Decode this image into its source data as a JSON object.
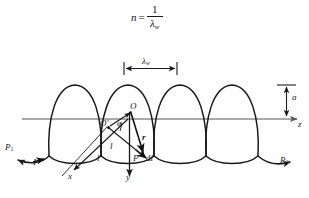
{
  "figure": {
    "type": "physics-diagram",
    "formula": {
      "variable": "n",
      "equals": "=",
      "numerator": "1",
      "denominator_symbol": "λ",
      "denominator_subscript": "w"
    },
    "axis": {
      "z_label": "z",
      "x_label": "x",
      "y_label": "y"
    },
    "measurements": {
      "wavelength_label": "λ",
      "wavelength_subscript": "w",
      "amplitude_label": "a"
    },
    "points": {
      "origin_label": "O",
      "source_label": "O′",
      "field_point_label": "P",
      "terminal_left_label": "P",
      "terminal_left_subscript": "1",
      "terminal_right_label": "P",
      "terminal_right_subscript": "2"
    },
    "vectors": {
      "radius_label": "r",
      "element_prefix": "d",
      "element_symbol": "l",
      "current_label": "I",
      "arc_length_label_1": "l",
      "arc_length_label_2": "l",
      "angle_label": "φ"
    },
    "colors": {
      "stroke": "#1a1a1a",
      "axis": "#555555",
      "background": "#ffffff"
    },
    "geometry": {
      "loop_count": 4,
      "loop_centers_x": [
        75,
        128,
        180,
        232
      ],
      "axis_y": 119,
      "loop_top_y": 85,
      "loop_bottom_y": 156,
      "loop_half_width": 26,
      "wavelength_span_x": [
        124,
        177
      ],
      "wavelength_tick_y": 68
    }
  }
}
